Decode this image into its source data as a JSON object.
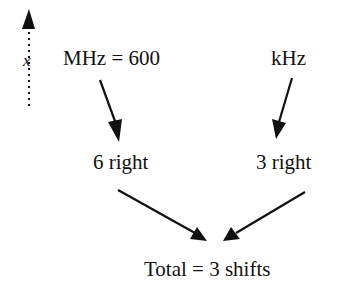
{
  "diagram": {
    "axis_label": "x",
    "labels": {
      "mhz": "MHz = 600",
      "khz": "kHz",
      "left_shift": "6 right",
      "right_shift": "3 right",
      "total": "Total = 3 shifts"
    },
    "arrows": [
      {
        "from": "mhz",
        "to": "left_shift"
      },
      {
        "from": "khz",
        "to": "right_shift"
      },
      {
        "from": "left_shift",
        "to": "total"
      },
      {
        "from": "right_shift",
        "to": "total"
      }
    ],
    "colors": {
      "ink": "#111111",
      "background": "#ffffff"
    }
  }
}
